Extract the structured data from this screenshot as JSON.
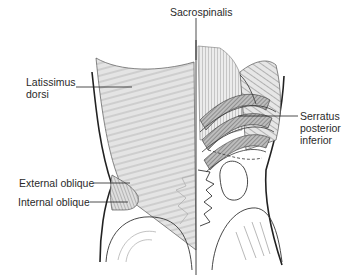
{
  "diagram": {
    "type": "anatomical-illustration",
    "labels": [
      {
        "id": "sacrospinalis",
        "lines": [
          "Sacrospinalis"
        ]
      },
      {
        "id": "latissimus-dorsi",
        "lines": [
          "Latissimus",
          "dorsi"
        ]
      },
      {
        "id": "serratus-posterior-inferior",
        "lines": [
          "Serratus",
          "posterior",
          "inferior"
        ]
      },
      {
        "id": "external-oblique",
        "lines": [
          "External oblique"
        ]
      },
      {
        "id": "internal-oblique",
        "lines": [
          "Internal oblique"
        ]
      }
    ],
    "colors": {
      "line": "#2a2a2a",
      "muscle_fill": "#dcdcdc",
      "muscle_dark": "#9a9a9a",
      "hatch": "#6f6f6f"
    }
  }
}
